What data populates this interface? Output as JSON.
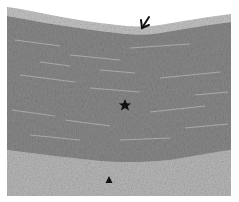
{
  "figure": {
    "type": "histology-micrograph",
    "colors": {
      "background": "#ffffff",
      "media_tone": "#8a8a8a",
      "adventitia_tone": "#b4b4b4",
      "intima_edge_tone": "#c8c8c8",
      "marker": "#111111"
    },
    "markers": [
      {
        "name": "arrow",
        "symbol": "arrow-down-left-icon",
        "x": 143,
        "y": 22
      },
      {
        "name": "star",
        "symbol": "star-icon",
        "x": 125,
        "y": 105
      },
      {
        "name": "triangle",
        "symbol": "triangle-up-icon",
        "x": 109,
        "y": 180
      }
    ]
  }
}
